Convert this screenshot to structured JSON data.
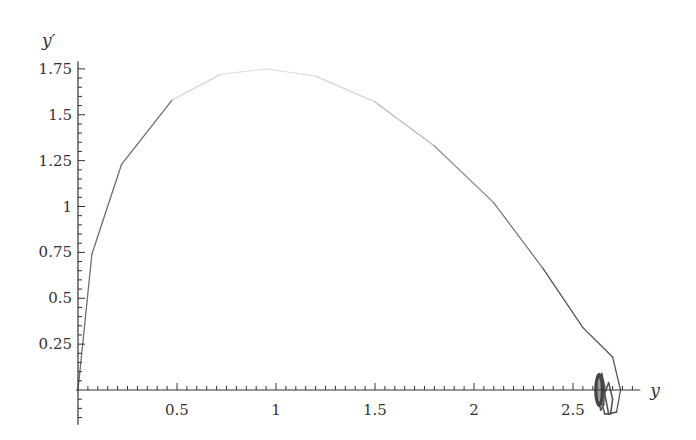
{
  "chart_data": {
    "type": "line",
    "title": "",
    "xlabel": "y",
    "ylabel": "y′",
    "xlim": [
      -0.01,
      2.84
    ],
    "ylim": [
      -0.19,
      1.79
    ],
    "grid": false,
    "legend": "none",
    "x_ticks": [
      {
        "value": 0.5,
        "label": "0.5"
      },
      {
        "value": 1,
        "label": "1"
      },
      {
        "value": 1.5,
        "label": "1.5"
      },
      {
        "value": 2,
        "label": "2"
      },
      {
        "value": 2.5,
        "label": "2.5"
      }
    ],
    "y_ticks": [
      {
        "value": 0.25,
        "label": "0.25"
      },
      {
        "value": 0.5,
        "label": "0.5"
      },
      {
        "value": 0.75,
        "label": "0.75"
      },
      {
        "value": 1,
        "label": "1"
      },
      {
        "value": 1.25,
        "label": "1.25"
      },
      {
        "value": 1.5,
        "label": "1.5"
      },
      {
        "value": 1.75,
        "label": "1.75"
      }
    ],
    "minor_tick_step": 0.05,
    "series": [
      {
        "name": "phase trajectory",
        "color": "#555555",
        "x": [
          0.0,
          0.07,
          0.22,
          0.475,
          0.72,
          0.95,
          1.2,
          1.5,
          1.8,
          2.1,
          2.35,
          2.55,
          2.7,
          2.74,
          2.72,
          2.68,
          2.66,
          2.68,
          2.7,
          2.69,
          2.66,
          2.64,
          2.635,
          2.645,
          2.66,
          2.655,
          2.64,
          2.63,
          2.625,
          2.635,
          2.645,
          2.64,
          2.63,
          2.628,
          2.632,
          2.636
        ],
        "y": [
          0.0,
          0.74,
          1.23,
          1.58,
          1.72,
          1.75,
          1.71,
          1.57,
          1.33,
          1.02,
          0.66,
          0.34,
          0.18,
          0.0,
          -0.12,
          -0.13,
          -0.02,
          0.04,
          -0.05,
          -0.13,
          -0.13,
          -0.05,
          0.05,
          0.09,
          0.02,
          -0.08,
          -0.11,
          -0.06,
          0.03,
          0.07,
          0.01,
          -0.06,
          -0.07,
          -0.01,
          0.04,
          0.0
        ]
      }
    ]
  }
}
